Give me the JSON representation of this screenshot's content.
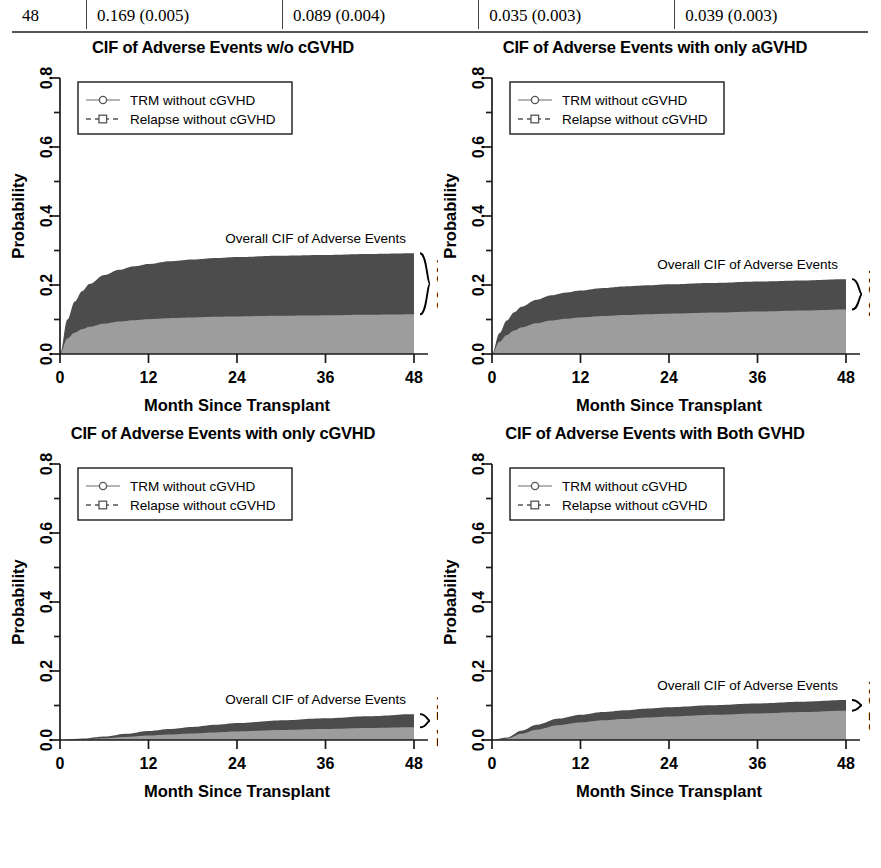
{
  "table_fragment": {
    "row_label": "48",
    "cells": [
      "0.169 (0.005)",
      "0.089 (0.004)",
      "0.035 (0.003)",
      "0.039 (0.003)"
    ]
  },
  "axis": {
    "xlabel": "Month Since Transplant",
    "ylabel": "Probability",
    "xticks": [
      "0",
      "12",
      "24",
      "36",
      "48"
    ],
    "yticks": [
      "0.0",
      "0.2",
      "0.4",
      "0.6",
      "0.8"
    ],
    "xlim": [
      0,
      48
    ],
    "ylim": [
      0,
      0.8
    ]
  },
  "legend": {
    "trm_label": "TRM without cGVHD",
    "relapse_label": "Relapse without cGVHD",
    "trm_marker": "circle-marker",
    "relapse_marker": "square-marker"
  },
  "colors": {
    "trm_fill": "#9d9d9d",
    "relapse_fill": "#4c4c4c",
    "axis": "#1a1a1a",
    "text": "#000000"
  },
  "annotation_label": "Overall CIF of Adverse Events",
  "chart_data": [
    {
      "type": "area",
      "title": "CIF of Adverse Events w/o cGVHD",
      "xlabel": "Month Since Transplant",
      "ylabel": "Probability",
      "xlim": [
        0,
        48
      ],
      "ylim": [
        0,
        0.8
      ],
      "grid": false,
      "legend_position": "top-left",
      "annotation": "Overall CIF of Adverse Events",
      "brace_percent": "60.6%",
      "x": [
        0,
        1,
        2,
        3,
        4,
        6,
        8,
        10,
        12,
        15,
        18,
        21,
        24,
        30,
        36,
        42,
        48
      ],
      "series": [
        {
          "name": "TRM without cGVHD",
          "values": [
            0.0,
            0.045,
            0.062,
            0.072,
            0.079,
            0.088,
            0.094,
            0.098,
            0.101,
            0.104,
            0.106,
            0.108,
            0.109,
            0.111,
            0.112,
            0.114,
            0.115
          ]
        },
        {
          "name": "Relapse without cGVHD",
          "values": [
            0.0,
            0.055,
            0.09,
            0.11,
            0.124,
            0.141,
            0.15,
            0.156,
            0.16,
            0.165,
            0.168,
            0.17,
            0.172,
            0.174,
            0.175,
            0.176,
            0.177
          ]
        }
      ],
      "overall_cif_at_48": 0.292
    },
    {
      "type": "area",
      "title": "CIF of Adverse Events with only aGVHD",
      "xlabel": "Month Since Transplant",
      "ylabel": "Probability",
      "xlim": [
        0,
        48
      ],
      "ylim": [
        0,
        0.8
      ],
      "grid": false,
      "legend_position": "top-left",
      "annotation": "Overall CIF of Adverse Events",
      "brace_percent": "40.2%",
      "x": [
        0,
        1,
        2,
        3,
        4,
        6,
        8,
        10,
        12,
        15,
        18,
        21,
        24,
        30,
        36,
        42,
        48
      ],
      "series": [
        {
          "name": "TRM without cGVHD",
          "values": [
            0.0,
            0.035,
            0.055,
            0.068,
            0.077,
            0.089,
            0.097,
            0.102,
            0.106,
            0.11,
            0.113,
            0.115,
            0.117,
            0.12,
            0.123,
            0.126,
            0.129
          ]
        },
        {
          "name": "Relapse without cGVHD",
          "values": [
            0.0,
            0.025,
            0.042,
            0.053,
            0.06,
            0.068,
            0.073,
            0.076,
            0.078,
            0.081,
            0.083,
            0.084,
            0.085,
            0.086,
            0.087,
            0.087,
            0.088
          ]
        }
      ],
      "overall_cif_at_48": 0.217
    },
    {
      "type": "area",
      "title": "CIF of Adverse Events with only cGVHD",
      "xlabel": "Month Since Transplant",
      "ylabel": "Probability",
      "xlim": [
        0,
        48
      ],
      "ylim": [
        0,
        0.8
      ],
      "grid": false,
      "legend_position": "top-left",
      "annotation": "Overall CIF of Adverse Events",
      "brace_percent": "51.5%",
      "x": [
        0,
        3,
        6,
        9,
        12,
        15,
        18,
        21,
        24,
        30,
        36,
        42,
        48
      ],
      "series": [
        {
          "name": "TRM without cGVHD",
          "values": [
            0.0,
            0.002,
            0.005,
            0.009,
            0.013,
            0.016,
            0.019,
            0.022,
            0.025,
            0.029,
            0.032,
            0.035,
            0.037
          ]
        },
        {
          "name": "Relapse without cGVHD",
          "values": [
            0.0,
            0.002,
            0.005,
            0.009,
            0.013,
            0.016,
            0.019,
            0.022,
            0.024,
            0.028,
            0.031,
            0.034,
            0.038
          ]
        }
      ],
      "overall_cif_at_48": 0.075
    },
    {
      "type": "area",
      "title": "CIF of Adverse Events with Both GVHD",
      "xlabel": "Month Since Transplant",
      "ylabel": "Probability",
      "xlim": [
        0,
        48
      ],
      "ylim": [
        0,
        0.8
      ],
      "grid": false,
      "legend_position": "top-left",
      "annotation": "Overall CIF of Adverse Events",
      "brace_percent": "35.8%",
      "x": [
        0,
        2,
        4,
        6,
        9,
        12,
        15,
        18,
        21,
        24,
        30,
        36,
        42,
        48
      ],
      "series": [
        {
          "name": "TRM without cGVHD",
          "values": [
            0.0,
            0.004,
            0.018,
            0.03,
            0.043,
            0.051,
            0.057,
            0.061,
            0.065,
            0.068,
            0.073,
            0.077,
            0.081,
            0.085
          ]
        },
        {
          "name": "Relapse without cGVHD",
          "values": [
            0.0,
            0.003,
            0.009,
            0.014,
            0.019,
            0.022,
            0.024,
            0.025,
            0.026,
            0.027,
            0.028,
            0.029,
            0.03,
            0.031
          ]
        }
      ],
      "overall_cif_at_48": 0.116
    }
  ]
}
